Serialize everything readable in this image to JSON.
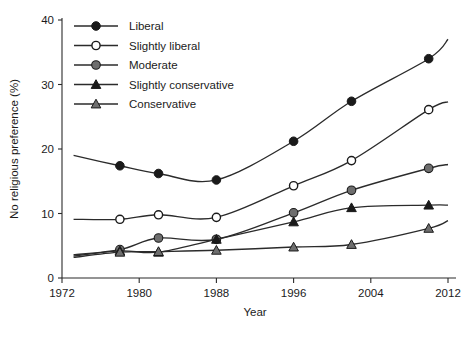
{
  "chart_data": {
    "type": "line",
    "title": "",
    "xlabel": "Year",
    "ylabel": "No religious preference (%)",
    "xlim": [
      1972,
      2012
    ],
    "ylim": [
      0,
      40
    ],
    "xticks": [
      1972,
      1980,
      1988,
      1996,
      2004,
      2012
    ],
    "yticks": [
      0,
      10,
      20,
      30,
      40
    ],
    "xtick_labels": [
      "1972",
      "1980",
      "1988",
      "1996",
      "2004",
      "2012"
    ],
    "ytick_labels": [
      "0",
      "10",
      "20",
      "30",
      "40"
    ],
    "grid": false,
    "legend_position": "top-left",
    "x": [
      1978,
      1982,
      1988,
      1996,
      2002,
      2010
    ],
    "series": [
      {
        "name": "Liberal",
        "marker": "filled-circle",
        "values": [
          17.4,
          16.2,
          15.2,
          21.2,
          27.4,
          34.0
        ],
        "lead_in": 19.0,
        "lead_out": 37.0
      },
      {
        "name": "Slightly liberal",
        "marker": "open-circle",
        "values": [
          9.1,
          9.8,
          9.4,
          14.3,
          18.2,
          26.1
        ],
        "lead_in": 9.1,
        "lead_out": 27.3
      },
      {
        "name": "Moderate",
        "marker": "grey-circle",
        "values": [
          4.4,
          6.2,
          6.0,
          10.1,
          13.6,
          17.0
        ],
        "lead_in": 3.6,
        "lead_out": 17.6
      },
      {
        "name": "Slightly conservative",
        "marker": "filled-triangle",
        "values": [
          4.2,
          4.0,
          6.0,
          8.7,
          10.9,
          11.3
        ],
        "lead_in": 3.4,
        "lead_out": 11.3
      },
      {
        "name": "Conservative",
        "marker": "grey-triangle",
        "values": [
          4.0,
          4.1,
          4.3,
          4.8,
          5.2,
          7.7
        ],
        "lead_in": 3.2,
        "lead_out": 8.9
      }
    ],
    "legend": [
      {
        "label": "Liberal",
        "marker": "filled-circle"
      },
      {
        "label": "Slightly liberal",
        "marker": "open-circle"
      },
      {
        "label": "Moderate",
        "marker": "grey-circle"
      },
      {
        "label": "Slightly conservative",
        "marker": "filled-triangle"
      },
      {
        "label": "Conservative",
        "marker": "grey-triangle"
      }
    ],
    "colors": {
      "axis": "#2b2b2b",
      "line": "#2b2b2b",
      "marker_dark": "#1a1a1a",
      "marker_grey": "#6e6e6e",
      "marker_open_fill": "#ffffff",
      "background": "#ffffff"
    }
  }
}
